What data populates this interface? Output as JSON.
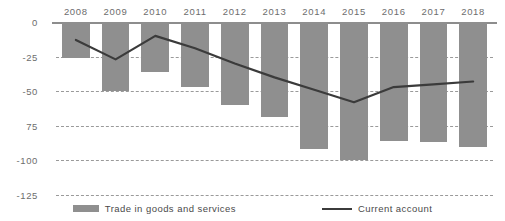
{
  "chart_data": {
    "type": "bar",
    "title": "",
    "subtitle": "",
    "xlabel": "",
    "ylabel": "",
    "categories": [
      "2008",
      "2009",
      "2010",
      "2011",
      "2012",
      "2013",
      "2014",
      "2015",
      "2016",
      "2017",
      "2018"
    ],
    "ylim": [
      -125,
      0
    ],
    "yticks": [
      0,
      -25,
      -50,
      -75,
      -100,
      -125
    ],
    "ytick_labels": [
      "0",
      "-25",
      "-50",
      "75",
      "-100",
      "-125"
    ],
    "grid": true,
    "legend_position": "bottom",
    "series": [
      {
        "name": "Trade in goods and services",
        "type": "bar",
        "color": "#8f8f8f",
        "values": [
          -26,
          -50,
          -36,
          -47,
          -60,
          -69,
          -92,
          -100,
          -86,
          -87,
          -90
        ]
      },
      {
        "name": "Current account",
        "type": "line",
        "color": "#3b3b3b",
        "values": [
          -13,
          -27,
          -10,
          -19,
          -30,
          -40,
          -49,
          -58,
          -47,
          -45,
          -43
        ]
      }
    ]
  },
  "legend": {
    "bar_label": "Trade in goods and services",
    "line_label": "Current account"
  },
  "colors": {
    "bar": "#8f8f8f",
    "line": "#3b3b3b",
    "grid": "#9a9a9a",
    "axis": "#8d8d8d",
    "tick_text": "#6d6d6d",
    "legend_text": "#4a4a4a",
    "background": "#ffffff"
  }
}
